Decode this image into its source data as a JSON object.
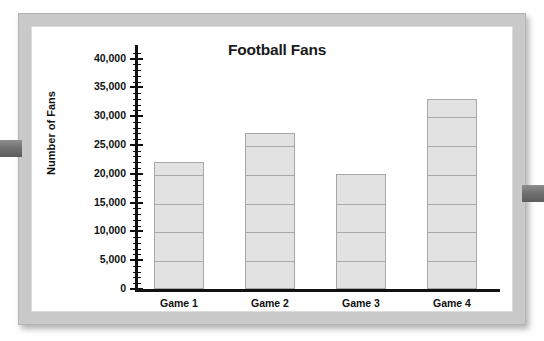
{
  "frame": {
    "left_tab_name": "left-binder-tab",
    "right_tab_name": "right-binder-tab"
  },
  "chart_data": {
    "type": "bar",
    "title": "Football Fans",
    "xlabel": "",
    "ylabel": "Number of Fans",
    "categories": [
      "Game 1",
      "Game 2",
      "Game 3",
      "Game 4"
    ],
    "values": [
      22000,
      27000,
      20000,
      33000
    ],
    "ylim": [
      0,
      42000
    ],
    "ytick_labels": [
      "0",
      "5,000",
      "10,000",
      "15,000",
      "20,000",
      "25,000",
      "30,000",
      "35,000",
      "40,000"
    ],
    "ytick_values": [
      0,
      5000,
      10000,
      15000,
      20000,
      25000,
      30000,
      35000,
      40000
    ],
    "minor_tick_interval": 1000,
    "grid": "horizontal-inside-bars",
    "legend": "none",
    "bar_fill_color": "#e2e2e2",
    "bar_border_color": "#a8a8a8",
    "axis_color": "#111111"
  }
}
